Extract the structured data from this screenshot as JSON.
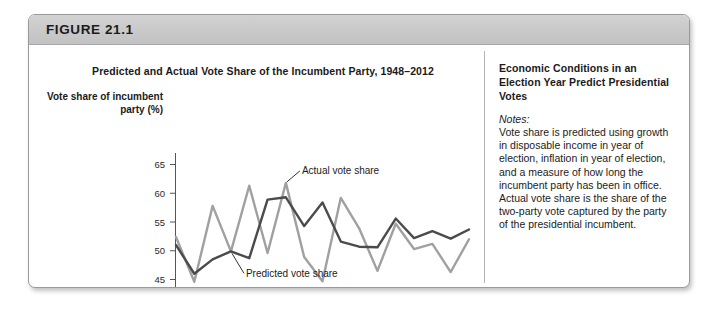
{
  "figure": {
    "label": "FIGURE 21.1"
  },
  "caption": {
    "heading": "Economic Conditions in an Election Year Predict Presidential Votes",
    "notes_label": "Notes:",
    "notes_body": "Vote share is predicted using growth in disposable income in year of election, inflation in year of election, and a measure of how long the incumbent party has been in office. Actual vote share is the share of the two-party vote captured by the party of the presidential incumbent."
  },
  "chart_data": {
    "type": "line",
    "title": "Predicted and Actual Vote Share of the Incumbent Party, 1948–2012",
    "xlabel": "Year",
    "ylabel": "Vote share of incumbent party (%)",
    "xlim": [
      1948,
      2012
    ],
    "ylim": [
      43,
      67
    ],
    "yticks": [
      45,
      50,
      55,
      60,
      65
    ],
    "grid": false,
    "legend_position": "inline-annotations",
    "x": [
      1948,
      1952,
      1956,
      1960,
      1964,
      1968,
      1972,
      1976,
      1980,
      1984,
      1988,
      1992,
      1996,
      2000,
      2004,
      2008,
      2012
    ],
    "series": [
      {
        "name": "Actual vote share",
        "color": "#a0a0a0",
        "values": [
          52.4,
          44.6,
          57.8,
          49.9,
          61.3,
          49.6,
          61.8,
          48.9,
          44.7,
          59.2,
          53.9,
          46.5,
          54.7,
          50.3,
          51.2,
          46.3,
          52.0
        ]
      },
      {
        "name": "Predicted vote share",
        "color": "#4b4b4b",
        "values": [
          51.0,
          46.0,
          48.5,
          49.9,
          48.7,
          58.9,
          59.3,
          54.3,
          58.4,
          51.6,
          50.7,
          50.6,
          55.6,
          52.2,
          53.4,
          52.1,
          53.7
        ]
      }
    ],
    "annotations": [
      {
        "text": "Actual vote share",
        "series": "Actual vote share"
      },
      {
        "text": "Predicted vote share",
        "series": "Predicted vote share"
      }
    ]
  }
}
